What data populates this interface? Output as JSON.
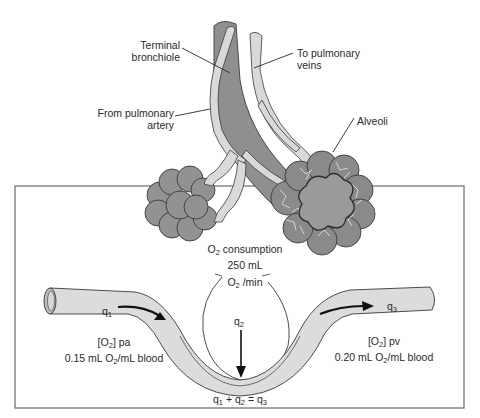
{
  "diagram": {
    "type": "fick-principle-pulmonary-blood-flow",
    "colors": {
      "bronchiole_fill": "#8f8f8f",
      "vessel_fill": "#d9d9d9",
      "alveoli_fill": "#929292",
      "blood_tube_fill": "#dcdcdc",
      "outline": "#3a3a3a",
      "box_border": "#6a6a6a",
      "background": "#ffffff"
    },
    "labels": {
      "terminal_bronchiole": [
        "Terminal",
        "bronchiole"
      ],
      "from_pulmonary_artery": [
        "From pulmonary",
        "artery"
      ],
      "to_pulmonary_veins": [
        "To pulmonary",
        "veins"
      ],
      "alveoli": "Alveoli"
    },
    "consumption": {
      "line1_prefix": "O",
      "line1_sub": "2",
      "line1_suffix": " consumption",
      "line2": "250 mL",
      "line3_prefix": "O",
      "line3_sub": "2",
      "line3_suffix": " /min"
    },
    "flows": {
      "q1": {
        "symbol": "q",
        "sub": "1"
      },
      "q2": {
        "symbol": "q",
        "sub": "2"
      },
      "q3": {
        "symbol": "q",
        "sub": "3"
      }
    },
    "pulmonary_artery": {
      "conc_prefix": "[O",
      "conc_sub": "2",
      "conc_suffix": "] pa",
      "value_prefix": "0.15 mL O",
      "value_sub": "2",
      "value_suffix": "/mL blood"
    },
    "pulmonary_vein": {
      "conc_prefix": "[O",
      "conc_sub": "2",
      "conc_suffix": "] pv",
      "value_prefix": "0.20 mL O",
      "value_sub": "2",
      "value_suffix": "/mL blood"
    },
    "equation": {
      "q1": "q",
      "q1_sub": "1",
      "plus": " + ",
      "q2": "q",
      "q2_sub": "2",
      "equals": " = ",
      "q3": "q",
      "q3_sub": "3"
    }
  }
}
